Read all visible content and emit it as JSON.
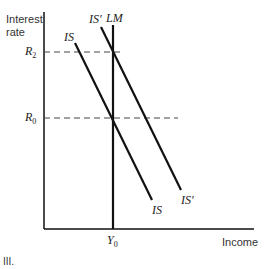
{
  "diagram": {
    "y_axis_label_line1": "Interest",
    "y_axis_label_line2": "rate",
    "x_axis_label": "Income",
    "curves": {
      "lm": "LM",
      "is_top": "IS",
      "is_bottom": "IS",
      "is_prime_top": "IS'",
      "is_prime_bottom": "IS'"
    },
    "y_ticks": [
      {
        "name": "R",
        "sub": "2"
      },
      {
        "name": "R",
        "sub": "0"
      }
    ],
    "x_ticks": [
      {
        "name": "Y",
        "sub": "0"
      }
    ],
    "caption": "III.",
    "colors": {
      "line": "#111111",
      "dash": "#444444",
      "background": "#ffffff"
    }
  }
}
